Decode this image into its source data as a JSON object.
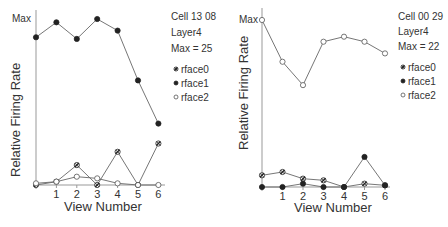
{
  "chart_data": [
    {
      "type": "line",
      "title": "Cell 13 08",
      "annotations": [
        "Cell 13 08",
        "Layer4",
        "Max = 25"
      ],
      "xlabel": "View Number",
      "ylabel": "Relative Firing Rate",
      "y_top_label": "Max",
      "x": [
        0,
        1,
        2,
        3,
        4,
        5,
        6
      ],
      "x_tick_labels": [
        "1",
        "2",
        "3",
        "4",
        "5",
        "6"
      ],
      "ylim": [
        0,
        1
      ],
      "grid": false,
      "legend_position": "right",
      "series": [
        {
          "name": "rface0",
          "marker": "star",
          "values": [
            0.0,
            0.02,
            0.12,
            0.0,
            0.2,
            0.0,
            0.25
          ]
        },
        {
          "name": "rface1",
          "marker": "filled",
          "values": [
            0.89,
            0.98,
            0.88,
            1.0,
            0.93,
            0.63,
            0.37
          ]
        },
        {
          "name": "rface2",
          "marker": "open",
          "values": [
            0.01,
            0.02,
            0.05,
            0.04,
            0.01,
            0.0,
            0.0
          ]
        }
      ]
    },
    {
      "type": "line",
      "title": "Cell 00 29",
      "annotations": [
        "Cell 00 29",
        "Layer4",
        "Max = 22"
      ],
      "xlabel": "View Number",
      "ylabel": "Relative Firing Rate",
      "y_top_label": "Max",
      "x": [
        0,
        1,
        2,
        3,
        4,
        5,
        6
      ],
      "x_tick_labels": [
        "1",
        "2",
        "3",
        "4",
        "5",
        "6"
      ],
      "ylim": [
        0,
        1
      ],
      "grid": false,
      "legend_position": "right",
      "series": [
        {
          "name": "rface0",
          "marker": "star",
          "values": [
            0.07,
            0.09,
            0.05,
            0.04,
            0.0,
            0.02,
            0.01
          ]
        },
        {
          "name": "rface1",
          "marker": "filled",
          "values": [
            0.0,
            0.0,
            0.02,
            0.0,
            0.0,
            0.18,
            0.01
          ]
        },
        {
          "name": "rface2",
          "marker": "open",
          "values": [
            1.0,
            0.75,
            0.61,
            0.87,
            0.9,
            0.87,
            0.8
          ]
        }
      ]
    }
  ]
}
